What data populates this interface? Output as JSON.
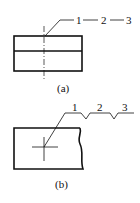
{
  "figure_a": {
    "labels": [
      "1",
      "2",
      "3"
    ],
    "caption": "(a)"
  },
  "figure_b": {
    "labels": [
      "1",
      "2",
      "3"
    ],
    "caption": "(b)"
  },
  "colors": {
    "line": "#111111",
    "background": "#ffffff"
  }
}
